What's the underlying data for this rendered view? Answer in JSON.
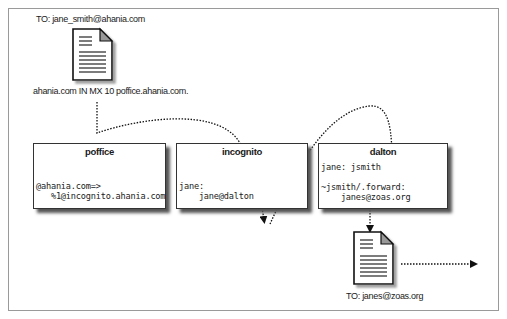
{
  "diagram": {
    "incoming_message": {
      "to_label": "TO: jane_smith@ahania.com",
      "icon": "document-icon",
      "dns_record": "ahania.com IN MX 10 poffice.ahania.com."
    },
    "hosts": [
      {
        "name": "poffice",
        "lines": [
          "@ahania.com=>",
          "   %1@incognito.ahania.com"
        ]
      },
      {
        "name": "incognito",
        "lines": [
          "jane:",
          "    jane@dalton"
        ]
      },
      {
        "name": "dalton",
        "lines": [
          "jane: jsmith",
          "",
          "~jsmith/.forward:",
          "    janes@zoas.org"
        ]
      }
    ],
    "outgoing_message": {
      "icon": "document-icon",
      "to_label": "TO: janes@zoas.org"
    },
    "colors": {
      "border": "#333333",
      "frame": "#9a9a9a",
      "shadow": "#555555",
      "arrow": "#111111"
    }
  }
}
